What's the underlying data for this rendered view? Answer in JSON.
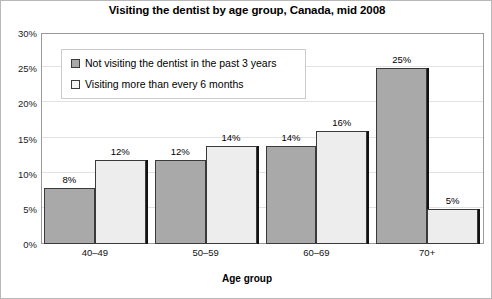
{
  "chart_data": {
    "type": "bar",
    "title": "Visiting the dentist by age group, Canada, mid 2008",
    "xlabel": "Age group",
    "ylabel": "",
    "categories": [
      "40–49",
      "50–59",
      "60–69",
      "70+"
    ],
    "series": [
      {
        "name": "Not visiting the dentist in the past 3 years",
        "color": "#a9a9a9",
        "values": [
          8,
          12,
          14,
          25
        ],
        "labels": [
          "8%",
          "12%",
          "14%",
          "25%"
        ]
      },
      {
        "name": "Visiting more than every 6 months",
        "color": "#ededed",
        "values": [
          12,
          14,
          16,
          5
        ],
        "labels": [
          "12%",
          "14%",
          "16%",
          "5%"
        ]
      }
    ],
    "ylim": [
      0,
      30
    ],
    "yticks": [
      0,
      5,
      10,
      15,
      20,
      25,
      30
    ],
    "ytick_labels": [
      "0%",
      "5%",
      "10%",
      "15%",
      "20%",
      "25%",
      "30%"
    ],
    "grid": true,
    "legend_position": "upper-left-inside"
  }
}
